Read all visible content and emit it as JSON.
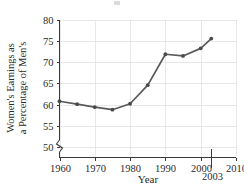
{
  "chart_data": {
    "type": "line",
    "title": "",
    "xlabel": "Year",
    "ylabel": "Women's Earnings as a Percentage of Men's",
    "ylabel_line1": "Women's Earnings as",
    "ylabel_line2": "a Percentage of Men's",
    "x": [
      1960,
      1965,
      1970,
      1975,
      1980,
      1985,
      1990,
      1995,
      2000,
      2003
    ],
    "values": [
      60.8,
      60.1,
      59.4,
      58.8,
      60.2,
      64.6,
      71.9,
      71.5,
      73.3,
      75.6
    ],
    "series": [
      {
        "name": "Women's Earnings as a Percentage of Men's",
        "values": [
          60.8,
          60.1,
          59.4,
          58.8,
          60.2,
          64.6,
          71.9,
          71.5,
          73.3,
          75.6
        ]
      }
    ],
    "xlim": [
      1960,
      2010
    ],
    "ylim": [
      47.5,
      80
    ],
    "xticks": [
      1960,
      1970,
      1980,
      1990,
      2000,
      2010
    ],
    "yticks": [
      50,
      55,
      60,
      65,
      70,
      75,
      80
    ],
    "xtick_labels": [
      "1960",
      "1970",
      "1980",
      "1990",
      "2000",
      "2010"
    ],
    "ytick_labels": [
      "50",
      "55",
      "60",
      "65",
      "70",
      "75",
      "80"
    ],
    "grid": true,
    "legend": "none",
    "y_axis_break": true,
    "annotations": [
      {
        "name": "year-2003-callout",
        "label": "2003",
        "x": 2003
      }
    ],
    "colors": {
      "line": "#5a5a5a",
      "marker": "#4a4a4a",
      "grid": "#e2e2e2",
      "axis": "#3a3a3a",
      "text": "#2b2b2b",
      "background": "#ffffff"
    }
  }
}
